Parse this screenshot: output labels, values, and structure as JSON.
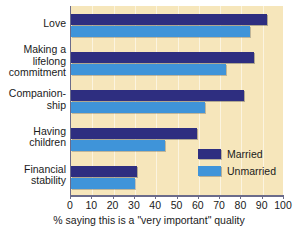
{
  "chart_data": {
    "type": "bar",
    "orientation": "horizontal",
    "title": "",
    "xlabel": "% saying this is a \"very important\" quality",
    "ylabel": "",
    "xlim": [
      0,
      100
    ],
    "xticks": [
      0,
      10,
      20,
      30,
      40,
      50,
      60,
      70,
      80,
      90,
      100
    ],
    "xtick_labels": [
      "0",
      "10",
      "20",
      "30",
      "40",
      "50",
      "60",
      "70",
      "80",
      "90",
      "100"
    ],
    "grid": true,
    "legend_position": "inside-lower-right",
    "categories": [
      "Love",
      "Making a\nlifelong\ncommitment",
      "Companion-\nship",
      "Having\nchildren",
      "Financial\nstability"
    ],
    "series": [
      {
        "name": "Married",
        "color": "#2e2e80",
        "values": [
          92,
          86,
          81,
          59,
          31
        ]
      },
      {
        "name": "Unmarried",
        "color": "#3f94d9",
        "values": [
          84,
          73,
          63,
          44,
          30
        ]
      }
    ]
  },
  "legend": {
    "items": [
      {
        "label": "Married",
        "color": "#2e2e80"
      },
      {
        "label": "Unmarried",
        "color": "#3f94d9"
      }
    ]
  },
  "colors": {
    "plot_background": "#f6e6bb",
    "page_background": "#ffffff",
    "axis": "#6b6b8a",
    "text": "#1a1a1a",
    "married": "#2e2e80",
    "unmarried": "#3f94d9"
  }
}
